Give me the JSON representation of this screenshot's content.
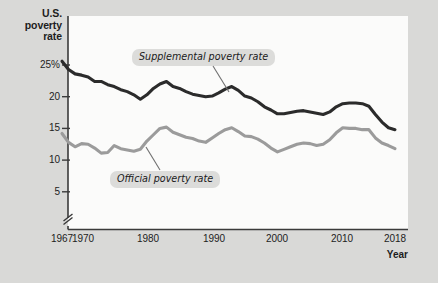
{
  "figure": {
    "background_color": "#d9d9d7",
    "plot_background_color": "#fbfbfa"
  },
  "axes": {
    "y_title_line1": "U.S.",
    "y_title_line2": "poverty",
    "y_title_line3": "rate",
    "x_title": "Year",
    "y_ticks": [
      "25%",
      "20",
      "15",
      "10",
      "5"
    ],
    "x_ticks": [
      "1967",
      "1970",
      "1980",
      "1990",
      "2000",
      "2010",
      "2018"
    ],
    "axis_break": true
  },
  "annotations": {
    "supplemental_label": "Supplemental poverty rate",
    "official_label": "Official poverty rate"
  },
  "chart_data": {
    "type": "line",
    "title": "U.S. poverty rate",
    "xlabel": "Year",
    "ylabel": "U.S. poverty rate",
    "xlim": [
      1967,
      2018
    ],
    "ylim": [
      4,
      27
    ],
    "grid": false,
    "legend_position": "inline-annotations",
    "y_axis_break": "axis broken between 0 and 5",
    "x": [
      1967,
      1968,
      1969,
      1970,
      1971,
      1972,
      1973,
      1974,
      1975,
      1976,
      1977,
      1978,
      1979,
      1980,
      1981,
      1982,
      1983,
      1984,
      1985,
      1986,
      1987,
      1988,
      1989,
      1990,
      1991,
      1992,
      1993,
      1994,
      1995,
      1996,
      1997,
      1998,
      1999,
      2000,
      2001,
      2002,
      2003,
      2004,
      2005,
      2006,
      2007,
      2008,
      2009,
      2010,
      2011,
      2012,
      2013,
      2014,
      2015,
      2016,
      2017,
      2018
    ],
    "series": [
      {
        "name": "Supplemental poverty rate",
        "color": "#2b2b2b",
        "values": [
          25.6,
          24.3,
          23.6,
          23.4,
          23.1,
          22.4,
          22.4,
          21.9,
          21.6,
          21.1,
          20.8,
          20.3,
          19.6,
          20.3,
          21.3,
          22.0,
          22.4,
          21.6,
          21.3,
          20.8,
          20.4,
          20.2,
          20.0,
          20.1,
          20.6,
          21.2,
          21.6,
          21.0,
          20.1,
          19.8,
          19.2,
          18.4,
          17.9,
          17.3,
          17.3,
          17.5,
          17.7,
          17.8,
          17.6,
          17.4,
          17.2,
          17.6,
          18.4,
          18.9,
          19.0,
          19.0,
          18.9,
          18.5,
          17.2,
          16.0,
          15.1,
          14.8
        ]
      },
      {
        "name": "Official poverty rate",
        "color": "#9b9b9b",
        "values": [
          14.2,
          12.8,
          12.1,
          12.6,
          12.5,
          11.9,
          11.1,
          11.2,
          12.3,
          11.8,
          11.6,
          11.4,
          11.7,
          13.0,
          14.0,
          15.0,
          15.2,
          14.4,
          14.0,
          13.6,
          13.4,
          13.0,
          12.8,
          13.5,
          14.2,
          14.8,
          15.1,
          14.5,
          13.8,
          13.7,
          13.3,
          12.7,
          11.9,
          11.3,
          11.7,
          12.1,
          12.5,
          12.7,
          12.6,
          12.3,
          12.5,
          13.2,
          14.3,
          15.1,
          15.0,
          15.0,
          14.8,
          14.8,
          13.5,
          12.7,
          12.3,
          11.8
        ]
      }
    ]
  }
}
